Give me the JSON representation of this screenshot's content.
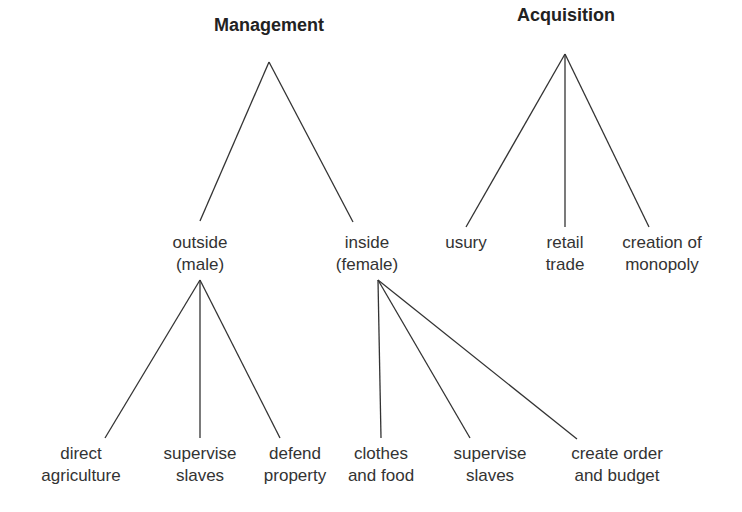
{
  "diagram": {
    "type": "tree",
    "colors": {
      "line": "#333333",
      "text": "#333333",
      "background": "#ffffff"
    },
    "nodes": {
      "management": {
        "lines": [
          "Management"
        ],
        "x": 269,
        "y": 14
      },
      "acquisition": {
        "lines": [
          "Acquisition"
        ],
        "x": 566,
        "y": 4
      },
      "outside": {
        "lines": [
          "outside",
          "(male)"
        ],
        "x": 200,
        "y": 232
      },
      "inside": {
        "lines": [
          "inside",
          "(female)"
        ],
        "x": 367,
        "y": 232
      },
      "usury": {
        "lines": [
          "usury"
        ],
        "x": 466,
        "y": 232
      },
      "retail_trade": {
        "lines": [
          "retail",
          "trade"
        ],
        "x": 565,
        "y": 232
      },
      "creation_monopoly": {
        "lines": [
          "creation of",
          "monopoly"
        ],
        "x": 662,
        "y": 232
      },
      "direct_agriculture": {
        "lines": [
          "direct",
          "agriculture"
        ],
        "x": 81,
        "y": 443
      },
      "supervise_slaves_m": {
        "lines": [
          "supervise",
          "slaves"
        ],
        "x": 200,
        "y": 443
      },
      "defend_property": {
        "lines": [
          "defend",
          "property"
        ],
        "x": 295,
        "y": 443
      },
      "clothes_food": {
        "lines": [
          "clothes",
          "and food"
        ],
        "x": 381,
        "y": 443
      },
      "supervise_slaves_f": {
        "lines": [
          "supervise",
          "slaves"
        ],
        "x": 490,
        "y": 443
      },
      "create_order_budget": {
        "lines": [
          "create order",
          "and budget"
        ],
        "x": 617,
        "y": 443
      }
    },
    "edges": [
      {
        "from": "management",
        "to": "outside",
        "x1": 269,
        "y1": 62,
        "x2": 200,
        "y2": 221
      },
      {
        "from": "management",
        "to": "inside",
        "x1": 269,
        "y1": 62,
        "x2": 353,
        "y2": 222
      },
      {
        "from": "acquisition",
        "to": "usury",
        "x1": 565,
        "y1": 54,
        "x2": 466,
        "y2": 227
      },
      {
        "from": "acquisition",
        "to": "retail_trade",
        "x1": 565,
        "y1": 54,
        "x2": 565,
        "y2": 227
      },
      {
        "from": "acquisition",
        "to": "creation_monopoly",
        "x1": 565,
        "y1": 54,
        "x2": 649,
        "y2": 227
      },
      {
        "from": "outside",
        "to": "direct_agriculture",
        "x1": 200,
        "y1": 280,
        "x2": 105,
        "y2": 438
      },
      {
        "from": "outside",
        "to": "supervise_slaves_m",
        "x1": 200,
        "y1": 280,
        "x2": 200,
        "y2": 438
      },
      {
        "from": "outside",
        "to": "defend_property",
        "x1": 200,
        "y1": 280,
        "x2": 280,
        "y2": 438
      },
      {
        "from": "inside",
        "to": "clothes_food",
        "x1": 378,
        "y1": 280,
        "x2": 381,
        "y2": 438
      },
      {
        "from": "inside",
        "to": "supervise_slaves_f",
        "x1": 378,
        "y1": 280,
        "x2": 470,
        "y2": 438
      },
      {
        "from": "inside",
        "to": "create_order_budget",
        "x1": 378,
        "y1": 280,
        "x2": 577,
        "y2": 439
      }
    ]
  }
}
